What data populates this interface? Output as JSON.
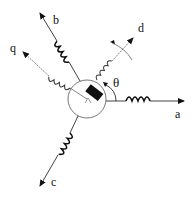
{
  "diagram": {
    "axes": {
      "a": {
        "label": "a"
      },
      "b": {
        "label": "b"
      },
      "c": {
        "label": "c"
      },
      "d": {
        "label": "d"
      },
      "q": {
        "label": "q"
      }
    },
    "angle_label": "θ",
    "colors": {
      "stroke": "#111111",
      "background": "#ffffff"
    }
  }
}
